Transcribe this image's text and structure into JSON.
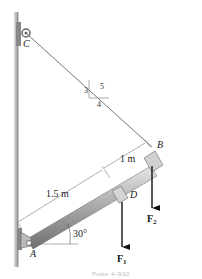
{
  "diagram": {
    "points": {
      "A": "A",
      "B": "B",
      "C": "C",
      "D": "D"
    },
    "dimensions": {
      "AD": "1.5 m",
      "DB": "1 m"
    },
    "angle": "30°",
    "slope": {
      "rise": "3",
      "run": "4",
      "hyp": "5"
    },
    "forces": {
      "F1": "F",
      "F1_sub": "1",
      "F2": "F",
      "F2_sub": "2"
    },
    "caption": "Probs. 4–9/10",
    "colors": {
      "rod": "#9a9a9a",
      "wall": "#c8c8c8",
      "cable": "#555555",
      "force": "#111111"
    }
  }
}
